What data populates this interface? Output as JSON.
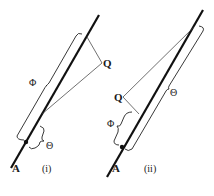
{
  "diagram": {
    "panels": [
      {
        "id": "i",
        "caption": "(i)",
        "point_label": "A",
        "external_point_label": "Q",
        "brackets": [
          {
            "label": "Φ",
            "side": "left",
            "span": "long"
          },
          {
            "label": "Θ",
            "side": "right",
            "span": "short"
          }
        ]
      },
      {
        "id": "ii",
        "caption": "(ii)",
        "point_label": "A",
        "external_point_label": "Q",
        "brackets": [
          {
            "label": "Φ",
            "side": "left",
            "span": "short"
          },
          {
            "label": "Θ",
            "side": "right",
            "span": "long"
          }
        ]
      }
    ],
    "colors": {
      "line": "#111111",
      "thin": "#333333",
      "background": "#ffffff"
    }
  }
}
